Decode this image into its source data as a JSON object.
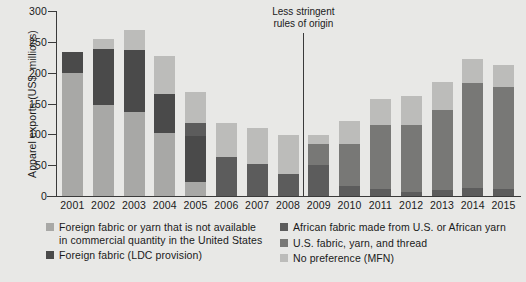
{
  "chart_data": {
    "type": "bar",
    "subtype": "stacked-vertical",
    "title": "",
    "xlabel": "",
    "ylabel": "Apparel exports (US$, millions)",
    "ylim": [
      0,
      300
    ],
    "ytick_values": [
      0,
      50,
      100,
      150,
      200,
      250,
      300
    ],
    "ytick_labels": [
      "0",
      "50",
      "100",
      "150",
      "200",
      "250",
      "300"
    ],
    "grid": false,
    "legend_position": "bottom",
    "categories": [
      "2001",
      "2002",
      "2003",
      "2004",
      "2005",
      "2006",
      "2007",
      "2008",
      "2009",
      "2010",
      "2011",
      "2012",
      "2013",
      "2014",
      "2015"
    ],
    "series": [
      {
        "name": "Foreign fabric or yarn that is not available in commercial quantity in the United States",
        "short_name": "Foreign fabric or yarn not available in commercial quantity",
        "color": "#a8a8a6",
        "values": [
          200,
          148,
          136,
          102,
          22,
          0,
          0,
          0,
          0,
          0,
          0,
          0,
          0,
          0,
          0
        ]
      },
      {
        "name": "Foreign fabric (LDC provision)",
        "short_name": "Foreign fabric (LDC provision)",
        "color": "#4a4a4a",
        "values": [
          33,
          91,
          101,
          63,
          76,
          0,
          0,
          0,
          0,
          0,
          0,
          0,
          0,
          0,
          0
        ]
      },
      {
        "name": "African fabric made from U.S. or African yarn",
        "short_name": "African fabric from U.S. or African yarn",
        "color": "#5c5c5c",
        "values": [
          0,
          0,
          0,
          0,
          20,
          64,
          52,
          36,
          50,
          17,
          12,
          7,
          10,
          13,
          12
        ]
      },
      {
        "name": "U.S. fabric, yarn, and thread",
        "short_name": "U.S. fabric, yarn, and thread",
        "color": "#787876",
        "values": [
          0,
          0,
          0,
          0,
          0,
          0,
          0,
          0,
          34,
          68,
          103,
          108,
          130,
          170,
          165
        ]
      },
      {
        "name": "No preference (MFN)",
        "short_name": "No preference (MFN)",
        "color": "#bcbcba",
        "values": [
          0,
          16,
          32,
          62,
          51,
          54,
          59,
          63,
          15,
          36,
          42,
          47,
          45,
          39,
          36
        ]
      }
    ],
    "totals": [
      233,
      255,
      269,
      227,
      169,
      118,
      111,
      99,
      99,
      121,
      157,
      162,
      185,
      222,
      213
    ],
    "annotations": [
      {
        "text": "Less stringent\nrules of origin",
        "x_between": [
          "2008",
          "2009"
        ],
        "has_vertical_divider": true
      }
    ]
  },
  "legend": {
    "left_column": [
      {
        "label_line1": "Foreign fabric or yarn that is not available",
        "label_line2": "in commercial quantity in the United States",
        "color": "#a8a8a6"
      },
      {
        "label_line1": "Foreign fabric (LDC provision)",
        "label_line2": "",
        "color": "#4a4a4a"
      }
    ],
    "right_column": [
      {
        "label_line1": "African fabric made from U.S. or African yarn",
        "label_line2": "",
        "color": "#5c5c5c"
      },
      {
        "label_line1": "U.S. fabric, yarn, and thread",
        "label_line2": "",
        "color": "#787876"
      },
      {
        "label_line1": "No preference (MFN)",
        "label_line2": "",
        "color": "#bcbcba"
      }
    ]
  },
  "colors": {
    "background": "#e8e8e6",
    "axis": "#3a3a3a",
    "text": "#1a1a1a"
  }
}
